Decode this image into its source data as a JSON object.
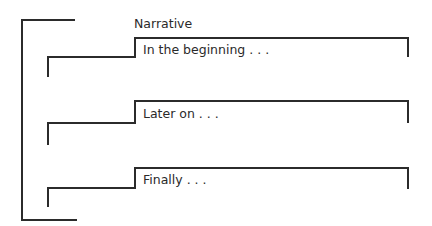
{
  "diagram": {
    "title": "Narrative",
    "line_color": "#2b2b2b",
    "sections": [
      {
        "label": "In the beginning . . ."
      },
      {
        "label": "Later on . . ."
      },
      {
        "label": "Finally . . ."
      }
    ]
  }
}
